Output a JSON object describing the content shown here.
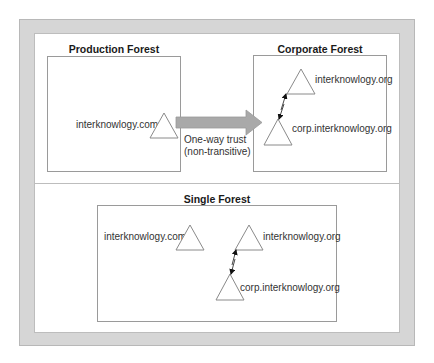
{
  "diagram": {
    "production_forest": {
      "title": "Production Forest",
      "domains": [
        {
          "label": "interknowlogy.com"
        }
      ]
    },
    "trust": {
      "line1": "One-way trust",
      "line2": "(non-transitive)",
      "arrow_color": "#a9a9a9"
    },
    "corporate_forest": {
      "title": "Corporate Forest",
      "domains": [
        {
          "label": "interknowlogy.org"
        },
        {
          "label": "corp.interknowlogy.org"
        }
      ]
    },
    "single_forest": {
      "title": "Single Forest",
      "domains": [
        {
          "label": "interknowlogy.com"
        },
        {
          "label": "interknowlogy.org"
        },
        {
          "label": "corp.interknowlogy.org"
        }
      ]
    }
  },
  "colors": {
    "frame": "#d6d6d6",
    "border": "#9a9a9a",
    "arrow": "#a9a9a9"
  }
}
